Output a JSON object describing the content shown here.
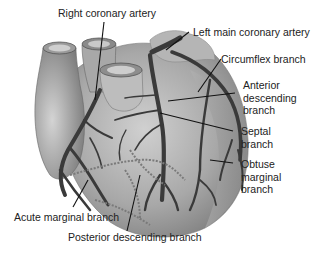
{
  "diagram": {
    "labels": {
      "right_coronary_artery": "Right coronary artery",
      "left_main_coronary_artery": "Left main coronary artery",
      "circumflex_branch": "Circumflex branch",
      "anterior_descending_branch": "Anterior\ndescending\nbranch",
      "septal_branch": "Septal\nbranch",
      "obtuse_marginal_branch": "Obtuse\nmarginal\nbranch",
      "acute_marginal_branch": "Acute marginal branch",
      "posterior_descending_branch": "Posterior descending branch"
    },
    "colors": {
      "heart_fill": "#9a9a9a",
      "heart_light": "#c8c8c8",
      "artery": "#3a3a3a",
      "posterior_vessel": "#7a7a7a",
      "leader_line": "#111111",
      "text": "#222222"
    }
  }
}
